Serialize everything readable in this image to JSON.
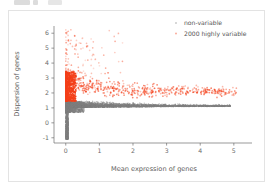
{
  "toolbar": {
    "blob_a": "",
    "blob_b": "",
    "blob_c": ""
  },
  "card": {
    "name": "plot-output-card"
  },
  "chart_data": {
    "type": "scatter",
    "title": "",
    "xlabel": "Mean expression of genes",
    "ylabel": "Dispersion of genes",
    "xlim": [
      -0.35,
      5.6
    ],
    "ylim": [
      -1.35,
      6.55
    ],
    "xticks": [
      0,
      1,
      2,
      3,
      4,
      5
    ],
    "xtick_labels": [
      "0",
      "1",
      "2",
      "3",
      "4",
      "5"
    ],
    "yticks": [
      -1,
      0,
      1,
      2,
      3,
      4,
      5,
      6
    ],
    "ytick_labels": [
      "-1",
      "0",
      "1",
      "2",
      "3",
      "4",
      "5",
      "6"
    ],
    "grid": false,
    "legend_position": "upper right",
    "colors": {
      "non_variable": "#808080",
      "highly_variable": "#F4401A",
      "axis": "#6e6e6e",
      "text": "#5d5d5d",
      "card_border": "#e3e3e3",
      "background": "#ffffff"
    },
    "series": [
      {
        "name": "non-variable",
        "color": "#808080",
        "marker": "point",
        "point_count_note": "dense gray band below dispersion ~1.45",
        "description": "Gray non-variable genes form a dense wedge hugging the x-axis, with a tall vertical spike near mean expression 0 descending to dispersion -1."
      },
      {
        "name": "2000 highly variable",
        "color": "#F4401A",
        "marker": "point",
        "point_count_note": "2000 selected highly variable genes",
        "description": "Orange highly-variable genes: saturated dense column at mean expression near 0 spanning dispersion 1.45-3.4, plus a faded scatter trailing right toward mean expression 5 around dispersion 2, and sparse outliers up to dispersion 6."
      }
    ],
    "legend": [
      {
        "label": "non-variable",
        "color": "#808080"
      },
      {
        "label": "2000 highly variable",
        "color": "#F4401A"
      }
    ]
  }
}
